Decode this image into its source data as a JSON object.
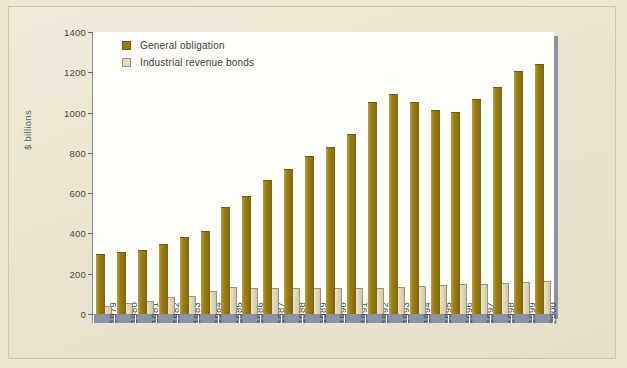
{
  "chart_data": {
    "type": "bar",
    "title": "",
    "subtitle": "",
    "xlabel": "",
    "ylabel": "$ billions",
    "ylim": [
      0,
      1400
    ],
    "ytick_interval": 200,
    "yticks": [
      "1400",
      "1200",
      "1000",
      "800",
      "600",
      "400",
      "200",
      "0"
    ],
    "grid": false,
    "legend_position": "top-left",
    "orientation": "vertical",
    "grouping": "grouped",
    "categories": [
      "1979",
      "1980",
      "1981",
      "1982",
      "1983",
      "1984",
      "1985",
      "1986",
      "1987",
      "1988",
      "1989",
      "1990",
      "1991",
      "1992",
      "1993",
      "1994",
      "1995",
      "1996",
      "1997",
      "1998",
      "1999",
      "2000"
    ],
    "series": [
      {
        "name": "General obligation",
        "color": "#9a7a11",
        "values": [
          300,
          310,
          320,
          350,
          383,
          410,
          530,
          585,
          663,
          722,
          785,
          827,
          893,
          1055,
          1090,
          1055,
          1015,
          1005,
          1065,
          1125,
          1205,
          1240
        ]
      },
      {
        "name": "Industrial revenue bonds",
        "color": "#ded7bd",
        "values": [
          40,
          55,
          63,
          85,
          90,
          113,
          133,
          128,
          128,
          128,
          128,
          130,
          127,
          128,
          135,
          140,
          145,
          147,
          150,
          153,
          158,
          165
        ]
      }
    ]
  },
  "legend": {
    "items": [
      {
        "label": "General obligation",
        "swatch_class": "general"
      },
      {
        "label": "Industrial revenue bonds",
        "swatch_class": "irb"
      }
    ]
  },
  "colors": {
    "page_background": "#ece7d3",
    "plot_background": "#fffefa",
    "shadow": "#8b93a8",
    "general_obligation": "#9a7a11",
    "industrial_revenue_bonds": "#ded7bd",
    "axis_line": "#8f8f8f",
    "axis_text": "#44484e"
  }
}
